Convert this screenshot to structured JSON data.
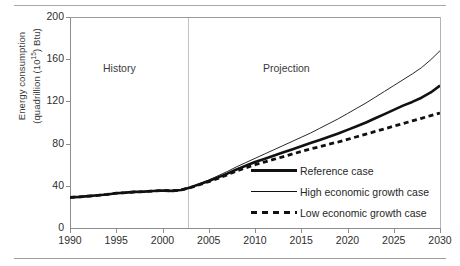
{
  "chart_data": {
    "type": "line",
    "title": "",
    "xlabel": "",
    "ylabel_line1": "Energy consumption",
    "ylabel_line2": "(quadrillion (10",
    "ylabel_exponent": "15",
    "ylabel_line2_end": ") Btu)",
    "xlim": [
      1990,
      2030
    ],
    "ylim": [
      0,
      200
    ],
    "yticks": [
      0,
      40,
      80,
      120,
      160,
      200
    ],
    "xticks": [
      1990,
      1995,
      2000,
      2005,
      2010,
      2015,
      2020,
      2025,
      2030
    ],
    "grid": false,
    "legend_position": "inside-lower-right",
    "annotations": [
      {
        "text": "History",
        "x": 1995
      },
      {
        "text": "Projection",
        "x": 2017
      }
    ],
    "history_projection_divider_x": 2002,
    "x": [
      1990,
      1991,
      1992,
      1993,
      1994,
      1995,
      1996,
      1997,
      1998,
      1999,
      2000,
      2001,
      2002,
      2003,
      2004,
      2005,
      2006,
      2007,
      2008,
      2009,
      2010,
      2011,
      2012,
      2013,
      2014,
      2015,
      2016,
      2017,
      2018,
      2019,
      2020,
      2021,
      2022,
      2023,
      2024,
      2025,
      2026,
      2027,
      2028,
      2029,
      2030
    ],
    "series": [
      {
        "name": "Reference case",
        "style": "thick-solid",
        "color": "#111111",
        "values": [
          29.0,
          29.5,
          30.2,
          31.0,
          31.8,
          33.0,
          33.5,
          34.2,
          34.5,
          35.0,
          35.6,
          35.2,
          36.0,
          38.5,
          41.5,
          44.5,
          48.0,
          51.5,
          55.5,
          59.0,
          62.5,
          65.5,
          68.5,
          71.5,
          74.5,
          77.5,
          80.5,
          83.5,
          86.5,
          89.5,
          93.0,
          96.5,
          100.0,
          104.0,
          108.0,
          112.0,
          116.0,
          119.5,
          123.5,
          128.5,
          135.0
        ]
      },
      {
        "name": "High economic growth case",
        "style": "thin-solid",
        "color": "#111111",
        "values": [
          29.0,
          29.5,
          30.2,
          31.0,
          31.8,
          33.0,
          33.5,
          34.2,
          34.5,
          35.0,
          35.6,
          35.2,
          36.0,
          38.8,
          42.0,
          45.5,
          49.5,
          53.5,
          58.0,
          62.0,
          66.0,
          70.0,
          74.0,
          78.0,
          82.0,
          86.0,
          90.0,
          94.5,
          99.0,
          103.5,
          108.5,
          113.5,
          118.5,
          124.0,
          129.5,
          135.0,
          140.5,
          146.0,
          152.0,
          159.5,
          168.0
        ]
      },
      {
        "name": "Low economic growth case",
        "style": "dashed",
        "color": "#111111",
        "values": [
          29.0,
          29.5,
          30.2,
          31.0,
          31.8,
          33.0,
          33.5,
          34.2,
          34.5,
          35.0,
          35.6,
          35.2,
          36.0,
          38.2,
          41.0,
          44.0,
          47.0,
          50.5,
          54.0,
          57.0,
          60.0,
          62.5,
          65.0,
          67.5,
          70.0,
          72.5,
          75.0,
          77.0,
          79.5,
          81.5,
          84.0,
          86.5,
          89.0,
          91.5,
          94.0,
          96.5,
          99.0,
          101.5,
          104.0,
          106.5,
          109.0
        ]
      }
    ],
    "legend": [
      {
        "label": "Reference case",
        "style": "thick-solid"
      },
      {
        "label": "High economic growth case",
        "style": "thin-solid"
      },
      {
        "label": "Low economic growth case",
        "style": "dashed"
      }
    ]
  }
}
